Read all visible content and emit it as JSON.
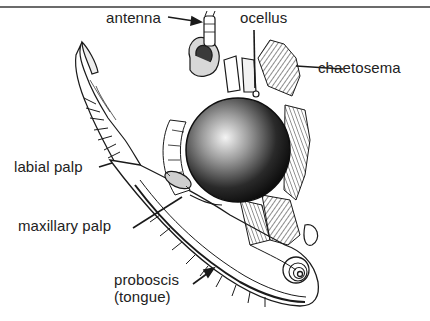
{
  "figure": {
    "labels": {
      "antenna": "antenna",
      "ocellus": "ocellus",
      "chaetosema": "chaetosema",
      "labial_palp": "labial palp",
      "maxillary_palp": "maxillary palp",
      "proboscis_line1": "proboscis",
      "proboscis_line2": "(tongue)"
    },
    "colors": {
      "ink": "#1a1a1a",
      "label_text": "#222222",
      "rule": "#6b6b6b",
      "background": "#ffffff"
    }
  }
}
